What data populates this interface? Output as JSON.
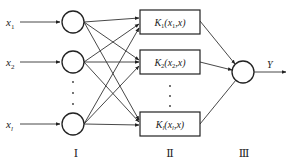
{
  "diagram": {
    "type": "neural-network",
    "inputs": [
      {
        "label": "x",
        "sub": "1"
      },
      {
        "label": "x",
        "sub": "2"
      },
      {
        "label": "x",
        "sub": "l"
      }
    ],
    "kernels": [
      {
        "main": "K",
        "sub": "1",
        "args_open": "(x",
        "args_sub": "1",
        "args_close": ",x)"
      },
      {
        "main": "K",
        "sub": "2",
        "args_open": "(x",
        "args_sub": "2",
        "args_close": ",x)"
      },
      {
        "main": "K",
        "sub": "l",
        "args_open": "(x",
        "args_sub": "l",
        "args_close": ",x)"
      }
    ],
    "output": {
      "label": "Y"
    },
    "layers": [
      {
        "label": "Ⅰ"
      },
      {
        "label": "Ⅱ"
      },
      {
        "label": "Ⅲ"
      }
    ],
    "colors": {
      "stroke": "#222222",
      "background": "#ffffff"
    }
  }
}
